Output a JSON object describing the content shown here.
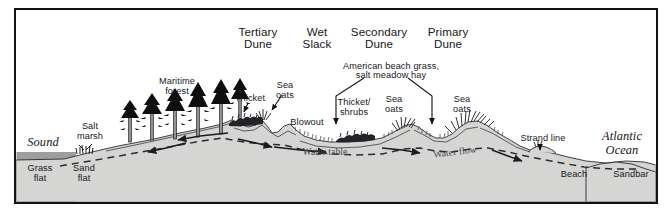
{
  "diagram": {
    "title_labels": [
      {
        "id": "tertiary-dune",
        "text": "Tertiary\nDune",
        "x": 258,
        "y": 26
      },
      {
        "id": "wet-slack",
        "text": "Wet\nSlack",
        "x": 315,
        "y": 26
      },
      {
        "id": "secondary-dune",
        "text": "Secondary\nDune",
        "x": 377,
        "y": 26
      },
      {
        "id": "primary-dune",
        "text": "Primary\nDune",
        "x": 443,
        "y": 26
      }
    ],
    "bracket_label": {
      "id": "american-beach-grass",
      "line1": "American beach grass,",
      "line2": "salt meadow hay",
      "x": 390,
      "y": 64
    },
    "feature_labels": [
      {
        "id": "maritime-forest",
        "text": "Maritime\nforest",
        "x": 177,
        "y": 80
      },
      {
        "id": "thicket",
        "text": "Thicket",
        "x": 250,
        "y": 98
      },
      {
        "id": "sea-oats-tertiary",
        "text": "Sea\noats",
        "x": 285,
        "y": 84
      },
      {
        "id": "blowout",
        "text": "Blowout",
        "x": 306,
        "y": 113
      },
      {
        "id": "thicket-shrubs",
        "text": "Thicket/\nshrubs",
        "x": 354,
        "y": 105
      },
      {
        "id": "sea-oats-slack",
        "text": "Sea\noats",
        "x": 394,
        "y": 103
      },
      {
        "id": "sea-oats-primary",
        "text": "Sea\noats",
        "x": 462,
        "y": 103
      },
      {
        "id": "strand-line",
        "text": "Strand line",
        "x": 543,
        "y": 140
      },
      {
        "id": "salt-marsh",
        "text": "Salt\nmarsh",
        "x": 90,
        "y": 129
      },
      {
        "id": "grass-flat",
        "text": "Grass\nflat",
        "x": 40,
        "y": 170
      },
      {
        "id": "sand-flat",
        "text": "Sand\nflat",
        "x": 84,
        "y": 170
      },
      {
        "id": "beach",
        "text": "Beach",
        "x": 574,
        "y": 174
      },
      {
        "id": "sandbar",
        "text": "Sandbar",
        "x": 630,
        "y": 174
      }
    ],
    "water_body_labels": [
      {
        "id": "sound",
        "text": "Sound",
        "x": 40,
        "y": 141
      },
      {
        "id": "atlantic-ocean",
        "line1": "Atlantic",
        "line2": "Ocean",
        "x": 620,
        "y": 138
      }
    ],
    "hydrology_labels": [
      {
        "id": "water-table",
        "text": "Water table",
        "x": 325,
        "y": 152
      },
      {
        "id": "water-flow",
        "text": "Water flow",
        "x": 455,
        "y": 152
      }
    ],
    "colors": {
      "land": "#d5d5d4",
      "water": "#9e9e9d",
      "frame": "#121212",
      "ink": "#16171a",
      "hydro_text": "#44454a",
      "background": "#ffffff"
    }
  }
}
